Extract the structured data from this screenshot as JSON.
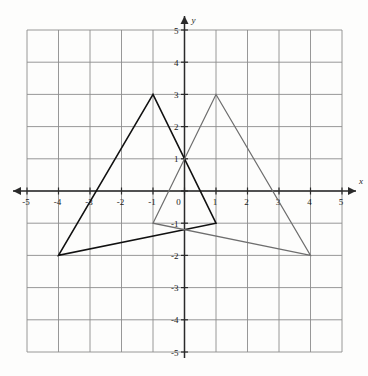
{
  "figure": {
    "kind": "coordinate-plane-with-triangles",
    "background_color": "#fdfdfc",
    "grid_color": "#8c8c8c",
    "axis_color": "#2a2a2a"
  },
  "axes": {
    "x": {
      "name": "x",
      "min": -5,
      "max": 5,
      "step": 1,
      "tick_labels": [
        "-5",
        "-4",
        "-3",
        "-2",
        "-1",
        "0",
        "1",
        "2",
        "3",
        "4",
        "5"
      ],
      "arrow_left": true,
      "arrow_right": true
    },
    "y": {
      "name": "y",
      "min": -5,
      "max": 5,
      "step": 1,
      "tick_labels": [
        "-5",
        "-4",
        "-3",
        "-2",
        "-1",
        "0",
        "1",
        "2",
        "3",
        "4",
        "5"
      ],
      "arrow_top": true,
      "arrow_bottom": false
    },
    "origin_label": "0"
  },
  "chart_data": {
    "type": "scatter",
    "title": "",
    "xlabel": "x",
    "ylabel": "y",
    "xlim": [
      -5,
      5
    ],
    "ylim": [
      -5,
      5
    ],
    "grid": true,
    "legend": "none",
    "shapes": [
      {
        "name": "triangle-dark",
        "label": "Triangle 1",
        "color": "#111111",
        "stroke_width": 1.6,
        "fill": "none",
        "closed": true,
        "vertices": [
          {
            "x": -4,
            "y": -2
          },
          {
            "x": -1,
            "y": 3
          },
          {
            "x": 1,
            "y": -1
          }
        ]
      },
      {
        "name": "triangle-light",
        "label": "Triangle 2",
        "color": "#6e6e6e",
        "stroke_width": 1.2,
        "fill": "none",
        "closed": true,
        "vertices": [
          {
            "x": -1,
            "y": -1
          },
          {
            "x": 1,
            "y": 3
          },
          {
            "x": 4,
            "y": -2
          }
        ]
      }
    ],
    "intersection_points": [
      {
        "x": 0,
        "y": 1
      }
    ]
  }
}
